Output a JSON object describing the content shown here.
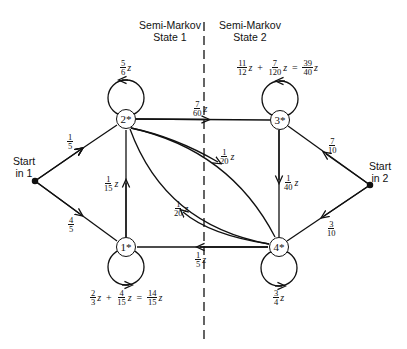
{
  "headers": {
    "state1": [
      "Semi-Markov",
      "State 1"
    ],
    "state2": [
      "Semi-Markov",
      "State 2"
    ]
  },
  "starts": {
    "start1": [
      "Start",
      "in 1"
    ],
    "start2": [
      "Start",
      "in 2"
    ]
  },
  "nodes": [
    {
      "id": "1",
      "label": "1*"
    },
    {
      "id": "2",
      "label": "2*"
    },
    {
      "id": "3",
      "label": "3*"
    },
    {
      "id": "4",
      "label": "4*"
    }
  ],
  "edges": {
    "start1_to_2": {
      "n": "1",
      "d": "5",
      "z": ""
    },
    "start1_to_1": {
      "n": "4",
      "d": "5",
      "z": ""
    },
    "start2_to_3": {
      "n": "7",
      "d": "10",
      "z": ""
    },
    "start2_to_4": {
      "n": "3",
      "d": "10",
      "z": ""
    },
    "loop2": {
      "n": "5",
      "d": "6",
      "z": "z"
    },
    "e2_to_3": {
      "n": "7",
      "d": "60",
      "z": "z"
    },
    "e1_to_2": {
      "n": "1",
      "d": "15",
      "z": "z"
    },
    "e2_to_4": {
      "n": "1",
      "d": "20",
      "z": "z"
    },
    "e4_to_2": {
      "n": "1",
      "d": "20",
      "z": "z"
    },
    "e3_to_4": {
      "n": "1",
      "d": "40",
      "z": "z"
    },
    "e4_to_1": {
      "n": "1",
      "d": "5",
      "z": "z"
    },
    "loop4": {
      "n": "3",
      "d": "4",
      "z": "z"
    },
    "loop3": {
      "terms": [
        {
          "n": "11",
          "d": "12"
        },
        {
          "n": "7",
          "d": "120"
        }
      ],
      "result": {
        "n": "39",
        "d": "40"
      },
      "z": "z",
      "plus": "+",
      "eq": "="
    },
    "loop1": {
      "terms": [
        {
          "n": "2",
          "d": "3"
        },
        {
          "n": "4",
          "d": "15"
        }
      ],
      "result": {
        "n": "14",
        "d": "15"
      },
      "z": "z",
      "plus": "+",
      "eq": "="
    }
  }
}
